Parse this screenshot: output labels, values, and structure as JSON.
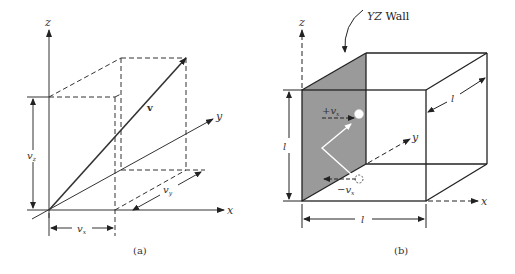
{
  "panel_a": {
    "caption": "(a)",
    "axes": {
      "x": "x",
      "y": "y",
      "z": "z"
    },
    "vector_label": "v",
    "components": {
      "vx": "v",
      "vx_sub": "x",
      "vy": "v",
      "vy_sub": "y",
      "vz": "v",
      "vz_sub": "z"
    }
  },
  "panel_b": {
    "caption": "(b)",
    "wall_label_italic": "YZ",
    "wall_label_text": " Wall",
    "axes": {
      "x": "x",
      "y": "y",
      "z": "z"
    },
    "edge_length": "l",
    "plus_vx": "+v",
    "minus_vx": "−v",
    "vx_sub": "x",
    "colors": {
      "wall_fill": "#999999",
      "line": "#222222"
    }
  }
}
